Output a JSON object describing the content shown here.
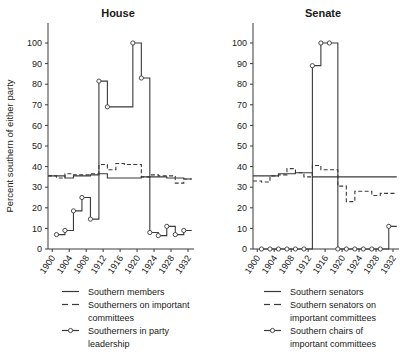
{
  "figure": {
    "ylabel": "Percent southern of either party"
  },
  "chart_data": [
    {
      "type": "line",
      "title": "House",
      "xlabel": "",
      "ylabel": "Percent southern of either party",
      "xlim": [
        1899,
        1932
      ],
      "ylim": [
        0,
        110
      ],
      "yticks": [
        0,
        10,
        20,
        30,
        40,
        50,
        60,
        70,
        80,
        90,
        100
      ],
      "xticks": [
        1900,
        1904,
        1908,
        1912,
        1916,
        1920,
        1924,
        1928,
        1932
      ],
      "grid": false,
      "legend_position": "below",
      "series": [
        {
          "name": "Southern members",
          "style": "solid",
          "markers": false,
          "x": [
            1899,
            1901,
            1903,
            1905,
            1907,
            1909,
            1911,
            1913,
            1915,
            1917,
            1919,
            1921,
            1923,
            1925,
            1927,
            1929,
            1931
          ],
          "values": [
            35.5,
            35.5,
            34.5,
            35.5,
            35.5,
            36.0,
            36.5,
            34.5,
            34.5,
            34.5,
            34.5,
            35.0,
            35.0,
            35.0,
            34.5,
            34.5,
            34.0
          ]
        },
        {
          "name": "Southerners on important committees",
          "style": "dashed",
          "markers": false,
          "x": [
            1899,
            1901,
            1903,
            1905,
            1907,
            1909,
            1911,
            1913,
            1915,
            1917,
            1919,
            1921,
            1923,
            1925,
            1927,
            1929,
            1931
          ],
          "values": [
            35.5,
            34.5,
            36.5,
            36.0,
            36.0,
            36.5,
            41.0,
            38.5,
            41.5,
            41.0,
            41.0,
            35.0,
            36.0,
            35.5,
            35.5,
            32.0,
            34.0
          ]
        },
        {
          "name": "Southerners in party leadership",
          "style": "solid-markers",
          "markers": true,
          "x": [
            1901,
            1903,
            1905,
            1907,
            1909,
            1911,
            1913,
            1919,
            1921,
            1923,
            1925,
            1927,
            1929,
            1931
          ],
          "values": [
            7.0,
            9.0,
            18.5,
            25.0,
            14.5,
            81.5,
            69.0,
            100.0,
            83.0,
            8.0,
            6.5,
            11.0,
            7.0,
            9.0
          ]
        }
      ]
    },
    {
      "type": "line",
      "title": "Senate",
      "xlabel": "",
      "ylabel": "",
      "xlim": [
        1899,
        1932
      ],
      "ylim": [
        0,
        110
      ],
      "yticks": [
        0,
        10,
        20,
        30,
        40,
        50,
        60,
        70,
        80,
        90,
        100
      ],
      "xticks": [
        1900,
        1904,
        1908,
        1912,
        1916,
        1920,
        1924,
        1928,
        1932
      ],
      "grid": false,
      "legend_position": "below",
      "series": [
        {
          "name": "Southern senators",
          "style": "solid",
          "markers": false,
          "x": [
            1899,
            1901,
            1903,
            1905,
            1907,
            1909,
            1911,
            1913,
            1915,
            1917,
            1919,
            1921,
            1923,
            1925,
            1927,
            1929,
            1931
          ],
          "values": [
            35.5,
            35.5,
            35.5,
            36.5,
            36.5,
            37.0,
            37.0,
            35.0,
            35.0,
            35.0,
            35.0,
            35.0,
            35.0,
            35.0,
            35.0,
            35.0,
            35.0
          ]
        },
        {
          "name": "Southern senators on important committees",
          "style": "dashed",
          "markers": false,
          "x": [
            1899,
            1901,
            1903,
            1905,
            1907,
            1909,
            1911,
            1913,
            1915,
            1917,
            1919,
            1921,
            1923,
            1925,
            1927,
            1929,
            1931
          ],
          "values": [
            33.0,
            32.5,
            35.5,
            36.0,
            39.0,
            37.0,
            35.0,
            40.5,
            38.5,
            38.5,
            30.5,
            23.0,
            28.0,
            28.0,
            26.0,
            27.0,
            27.0
          ]
        },
        {
          "name": "Southern chairs of important committees",
          "style": "solid-markers",
          "markers": true,
          "x": [
            1901,
            1903,
            1905,
            1907,
            1909,
            1911,
            1913,
            1915,
            1917,
            1919,
            1921,
            1923,
            1925,
            1927,
            1929,
            1931
          ],
          "values": [
            0,
            0,
            0,
            0,
            0,
            0,
            89.0,
            100.0,
            100.0,
            0,
            0,
            0,
            0,
            0,
            0,
            11.0
          ]
        }
      ]
    }
  ],
  "legends": [
    {
      "panel": "House",
      "entries": [
        {
          "label": "Southern members",
          "style": "solid"
        },
        {
          "label": "Southerners on important",
          "label2": "committees",
          "style": "dashed"
        },
        {
          "label": "Southerners in party",
          "label2": "leadership",
          "style": "marker"
        }
      ]
    },
    {
      "panel": "Senate",
      "entries": [
        {
          "label": "Southern senators",
          "style": "solid"
        },
        {
          "label": "Southern senators on",
          "label2": "important committees",
          "style": "dashed"
        },
        {
          "label": "Southern chairs of",
          "label2": "important committees",
          "style": "marker"
        }
      ]
    }
  ],
  "colors": {
    "ink": "#3a3a3a",
    "text": "#1a1a1a",
    "background": "#ffffff",
    "marker_fill": "#ffffff"
  }
}
